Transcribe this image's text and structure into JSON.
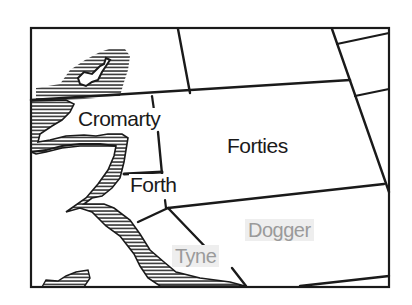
{
  "map": {
    "type": "shipping-forecast-sea-areas",
    "colors": {
      "line": "#1a1a1a",
      "hatch": "#1a1a1a",
      "background": "#ffffff",
      "faded_text": "#9a9a9a",
      "faded_bg": "#eeeeee"
    },
    "areas": [
      {
        "id": "cromarty",
        "label": "Cromarty",
        "state": "highlighted"
      },
      {
        "id": "forties",
        "label": "Forties",
        "state": "highlighted"
      },
      {
        "id": "forth",
        "label": "Forth",
        "state": "highlighted"
      },
      {
        "id": "dogger",
        "label": "Dogger",
        "state": "faded"
      },
      {
        "id": "tyne",
        "label": "Tyne",
        "state": "faded"
      }
    ]
  }
}
